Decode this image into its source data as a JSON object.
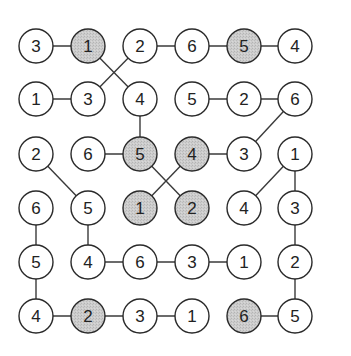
{
  "puzzle": {
    "rows": 6,
    "cols": 6,
    "col_x": [
      36,
      88,
      140,
      192,
      244,
      295
    ],
    "row_y": [
      46,
      99,
      154,
      208,
      262,
      316
    ],
    "radius": 17,
    "colors": {
      "stroke": "#2a2a2a",
      "white_fill": "#ffffff",
      "shaded_fill": "#c8c8c8",
      "line": "#3a3a3a",
      "text": "#222222"
    },
    "cells": [
      [
        {
          "v": "3",
          "s": false
        },
        {
          "v": "1",
          "s": true
        },
        {
          "v": "2",
          "s": false
        },
        {
          "v": "6",
          "s": false
        },
        {
          "v": "5",
          "s": true
        },
        {
          "v": "4",
          "s": false
        }
      ],
      [
        {
          "v": "1",
          "s": false
        },
        {
          "v": "3",
          "s": false
        },
        {
          "v": "4",
          "s": false
        },
        {
          "v": "5",
          "s": false
        },
        {
          "v": "2",
          "s": false
        },
        {
          "v": "6",
          "s": false
        }
      ],
      [
        {
          "v": "2",
          "s": false
        },
        {
          "v": "6",
          "s": false
        },
        {
          "v": "5",
          "s": true
        },
        {
          "v": "4",
          "s": true
        },
        {
          "v": "3",
          "s": false
        },
        {
          "v": "1",
          "s": false
        }
      ],
      [
        {
          "v": "6",
          "s": false
        },
        {
          "v": "5",
          "s": false
        },
        {
          "v": "1",
          "s": true
        },
        {
          "v": "2",
          "s": true
        },
        {
          "v": "4",
          "s": false
        },
        {
          "v": "3",
          "s": false
        }
      ],
      [
        {
          "v": "5",
          "s": false
        },
        {
          "v": "4",
          "s": false
        },
        {
          "v": "6",
          "s": false
        },
        {
          "v": "3",
          "s": false
        },
        {
          "v": "1",
          "s": false
        },
        {
          "v": "2",
          "s": false
        }
      ],
      [
        {
          "v": "4",
          "s": false
        },
        {
          "v": "2",
          "s": true
        },
        {
          "v": "3",
          "s": false
        },
        {
          "v": "1",
          "s": false
        },
        {
          "v": "6",
          "s": true
        },
        {
          "v": "5",
          "s": false
        }
      ]
    ],
    "edges": [
      [
        [
          0,
          0
        ],
        [
          0,
          1
        ]
      ],
      [
        [
          0,
          2
        ],
        [
          0,
          3
        ]
      ],
      [
        [
          0,
          3
        ],
        [
          0,
          4
        ]
      ],
      [
        [
          0,
          4
        ],
        [
          0,
          5
        ]
      ],
      [
        [
          0,
          1
        ],
        [
          1,
          2
        ]
      ],
      [
        [
          0,
          2
        ],
        [
          1,
          1
        ]
      ],
      [
        [
          1,
          0
        ],
        [
          1,
          1
        ]
      ],
      [
        [
          1,
          3
        ],
        [
          1,
          4
        ]
      ],
      [
        [
          1,
          4
        ],
        [
          1,
          5
        ]
      ],
      [
        [
          1,
          2
        ],
        [
          2,
          2
        ]
      ],
      [
        [
          1,
          5
        ],
        [
          2,
          4
        ]
      ],
      [
        [
          2,
          1
        ],
        [
          2,
          2
        ]
      ],
      [
        [
          2,
          3
        ],
        [
          2,
          4
        ]
      ],
      [
        [
          2,
          0
        ],
        [
          3,
          1
        ]
      ],
      [
        [
          2,
          2
        ],
        [
          3,
          3
        ]
      ],
      [
        [
          2,
          3
        ],
        [
          3,
          2
        ]
      ],
      [
        [
          2,
          5
        ],
        [
          3,
          4
        ]
      ],
      [
        [
          2,
          5
        ],
        [
          3,
          5
        ]
      ],
      [
        [
          3,
          0
        ],
        [
          4,
          0
        ]
      ],
      [
        [
          3,
          1
        ],
        [
          4,
          1
        ]
      ],
      [
        [
          3,
          5
        ],
        [
          4,
          5
        ]
      ],
      [
        [
          4,
          1
        ],
        [
          4,
          2
        ]
      ],
      [
        [
          4,
          2
        ],
        [
          4,
          3
        ]
      ],
      [
        [
          4,
          3
        ],
        [
          4,
          4
        ]
      ],
      [
        [
          4,
          0
        ],
        [
          5,
          0
        ]
      ],
      [
        [
          4,
          5
        ],
        [
          5,
          5
        ]
      ],
      [
        [
          5,
          0
        ],
        [
          5,
          1
        ]
      ],
      [
        [
          5,
          1
        ],
        [
          5,
          2
        ]
      ],
      [
        [
          5,
          2
        ],
        [
          5,
          3
        ]
      ],
      [
        [
          5,
          4
        ],
        [
          5,
          5
        ]
      ]
    ]
  }
}
